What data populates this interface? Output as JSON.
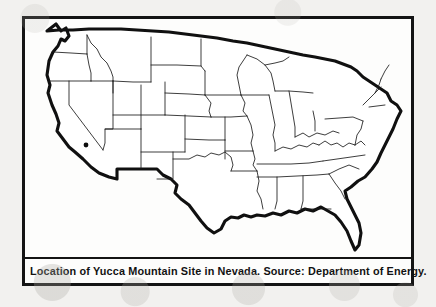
{
  "figure": {
    "caption": "Location of Yucca Mountain Site in Nevada.  Source:  Department of Energy.",
    "map_title": "Contiguous United States",
    "site_marker_label": "Yucca Mountain Site",
    "site_marker": {
      "x": 83,
      "y": 142
    },
    "colors": {
      "page_background": "#f2f1ef",
      "figure_background": "#fdfdfc",
      "frame_border": "#141414",
      "coastline": "#101010",
      "state_border": "#1b1b1b",
      "caption_text": "#121212",
      "site_dot": "#0d0d0d"
    },
    "frame": {
      "left": 22,
      "top": 16,
      "width": 392,
      "height": 270,
      "border_width": 3
    }
  }
}
